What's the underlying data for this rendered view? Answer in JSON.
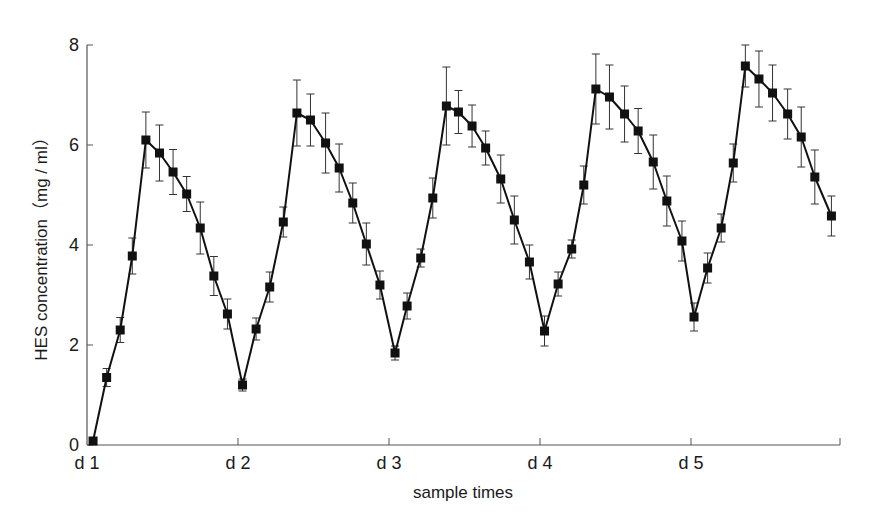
{
  "chart_data": {
    "type": "line",
    "title": "",
    "xlabel": "sample times",
    "ylabel": "HES concentration（mg / ml）",
    "ylim": [
      0,
      8
    ],
    "yticks": [
      0,
      2,
      4,
      6,
      8
    ],
    "xtick_labels": [
      "d 1",
      "d 2",
      "d 3",
      "d 4",
      "d 5"
    ],
    "xlim": [
      0,
      4.98
    ],
    "grid": false,
    "legend": null,
    "marker": "filled-square",
    "error_bars": true,
    "series": [
      {
        "name": "HES concentration",
        "color": "#111111",
        "x": [
          0.04,
          0.13,
          0.22,
          0.3,
          0.39,
          0.48,
          0.57,
          0.66,
          0.75,
          0.84,
          0.93,
          1.03,
          1.12,
          1.21,
          1.3,
          1.39,
          1.48,
          1.58,
          1.67,
          1.76,
          1.85,
          1.94,
          2.04,
          2.12,
          2.21,
          2.29,
          2.38,
          2.46,
          2.55,
          2.64,
          2.74,
          2.83,
          2.93,
          3.03,
          3.12,
          3.21,
          3.29,
          3.37,
          3.46,
          3.56,
          3.65,
          3.75,
          3.84,
          3.94,
          4.02,
          4.11,
          4.2,
          4.28,
          4.36,
          4.45,
          4.54,
          4.64,
          4.73,
          4.82,
          4.93
        ],
        "y": [
          0.08,
          1.35,
          2.3,
          3.78,
          6.1,
          5.84,
          5.46,
          5.02,
          4.34,
          3.38,
          2.62,
          1.2,
          2.32,
          3.16,
          4.46,
          6.64,
          6.5,
          6.04,
          5.54,
          4.84,
          4.02,
          3.2,
          1.84,
          2.78,
          3.74,
          4.94,
          6.78,
          6.66,
          6.38,
          5.94,
          5.32,
          4.5,
          3.66,
          2.28,
          3.22,
          3.92,
          5.2,
          7.12,
          6.96,
          6.62,
          6.28,
          5.66,
          4.88,
          4.08,
          2.56,
          3.54,
          4.34,
          5.64,
          7.58,
          7.32,
          7.04,
          6.62,
          6.16,
          5.36,
          4.58
        ],
        "err": [
          0.02,
          0.18,
          0.25,
          0.36,
          0.56,
          0.56,
          0.45,
          0.35,
          0.52,
          0.39,
          0.3,
          0.12,
          0.22,
          0.3,
          0.3,
          0.66,
          0.52,
          0.6,
          0.48,
          0.4,
          0.42,
          0.28,
          0.14,
          0.26,
          0.18,
          0.4,
          0.78,
          0.43,
          0.42,
          0.34,
          0.48,
          0.48,
          0.34,
          0.3,
          0.24,
          0.18,
          0.38,
          0.7,
          0.64,
          0.56,
          0.45,
          0.54,
          0.5,
          0.4,
          0.28,
          0.3,
          0.28,
          0.38,
          0.42,
          0.56,
          0.56,
          0.5,
          0.6,
          0.54,
          0.4
        ]
      }
    ]
  },
  "layout": {
    "plot_left": 87,
    "plot_right": 840,
    "plot_top": 45,
    "plot_bottom": 445,
    "day_spacing_px": 151
  },
  "labels": {
    "xlabel": "sample times",
    "ylabel": "HES concentration（mg / ml）"
  }
}
